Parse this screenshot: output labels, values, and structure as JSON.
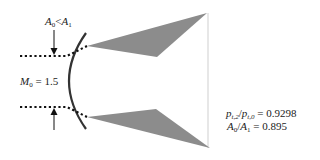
{
  "diagram": {
    "labels": {
      "area_ratio_top": {
        "A": "A",
        "sub0": "0",
        "op": "<",
        "A2": "A",
        "sub1": "1"
      },
      "mach": {
        "M": "M",
        "sub": "0",
        "eq": " = 1.5"
      },
      "pressure_ratio": {
        "p1": "p",
        "sub1": "t,2",
        "slash": "/",
        "p2": "p",
        "sub2": "t,0",
        "eq": " = 0.9298"
      },
      "area_ratio": {
        "A": "A",
        "sub0": "0",
        "slash": "/",
        "A2": "A",
        "sub1": "1",
        "eq": " = 0.895"
      }
    },
    "colors": {
      "wedge": "#8c8c8c",
      "curve": "#333333",
      "dots": "#111111",
      "line": "#cfcfcf"
    }
  }
}
